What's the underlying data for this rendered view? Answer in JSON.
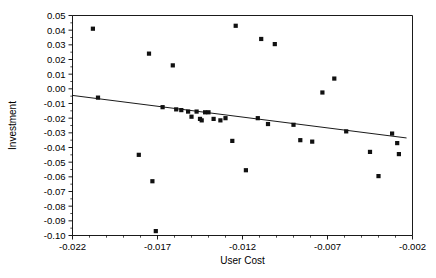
{
  "chart_data": {
    "type": "scatter",
    "title": "",
    "xlabel": "User Cost",
    "ylabel": "Investment",
    "xlim": [
      -0.022,
      -0.002
    ],
    "ylim": [
      -0.1,
      0.05
    ],
    "grid": false,
    "legend": null,
    "xticks": [
      -0.022,
      -0.017,
      -0.012,
      -0.007,
      -0.002
    ],
    "xtick_labels": [
      "-0.022",
      "-0.017",
      "-0.012",
      "-0.007",
      "-0.002"
    ],
    "x_minor_tick_step": 0.001,
    "yticks": [
      0.05,
      0.04,
      0.03,
      0.02,
      0.01,
      0.0,
      -0.01,
      -0.02,
      -0.03,
      -0.04,
      -0.05,
      -0.06,
      -0.07,
      -0.08,
      -0.09,
      -0.1
    ],
    "ytick_labels": [
      "0.05",
      "0.04",
      "0.03",
      "0.02",
      "0.01",
      "0.00",
      "-0.01",
      "-0.02",
      "-0.03",
      "-0.04",
      "-0.05",
      "-0.06",
      "-0.07",
      "-0.08",
      "-0.09",
      "-0.10"
    ],
    "marker": "square",
    "marker_size": 2.1,
    "marker_color": "#111111",
    "points": [
      {
        "x": -0.0208,
        "y": 0.041
      },
      {
        "x": -0.0205,
        "y": -0.006
      },
      {
        "x": -0.0181,
        "y": -0.045
      },
      {
        "x": -0.0175,
        "y": 0.024
      },
      {
        "x": -0.0173,
        "y": -0.063
      },
      {
        "x": -0.0171,
        "y": -0.097
      },
      {
        "x": -0.0167,
        "y": -0.0125
      },
      {
        "x": -0.0161,
        "y": 0.016
      },
      {
        "x": -0.0159,
        "y": -0.014
      },
      {
        "x": -0.0156,
        "y": -0.0145
      },
      {
        "x": -0.0152,
        "y": -0.0155
      },
      {
        "x": -0.015,
        "y": -0.019
      },
      {
        "x": -0.0147,
        "y": -0.0155
      },
      {
        "x": -0.0145,
        "y": -0.0205
      },
      {
        "x": -0.0144,
        "y": -0.0215
      },
      {
        "x": -0.0142,
        "y": -0.016
      },
      {
        "x": -0.014,
        "y": -0.016
      },
      {
        "x": -0.0137,
        "y": -0.0205
      },
      {
        "x": -0.0133,
        "y": -0.0215
      },
      {
        "x": -0.013,
        "y": -0.02
      },
      {
        "x": -0.0126,
        "y": -0.0355
      },
      {
        "x": -0.0124,
        "y": 0.043
      },
      {
        "x": -0.0118,
        "y": -0.0555
      },
      {
        "x": -0.0111,
        "y": -0.02
      },
      {
        "x": -0.0109,
        "y": 0.034
      },
      {
        "x": -0.0105,
        "y": -0.024
      },
      {
        "x": -0.0101,
        "y": 0.0305
      },
      {
        "x": -0.009,
        "y": -0.0245
      },
      {
        "x": -0.0086,
        "y": -0.035
      },
      {
        "x": -0.0079,
        "y": -0.036
      },
      {
        "x": -0.0073,
        "y": -0.0025
      },
      {
        "x": -0.0066,
        "y": 0.007
      },
      {
        "x": -0.0059,
        "y": -0.029
      },
      {
        "x": -0.0045,
        "y": -0.043
      },
      {
        "x": -0.004,
        "y": -0.0595
      },
      {
        "x": -0.0032,
        "y": -0.0305
      },
      {
        "x": -0.0029,
        "y": -0.037
      },
      {
        "x": -0.0028,
        "y": -0.0445
      }
    ],
    "fit_line": {
      "type": "linear_regression",
      "x_start": -0.022,
      "y_start": -0.0045,
      "x_end": -0.00235,
      "y_end": -0.0335
    }
  }
}
